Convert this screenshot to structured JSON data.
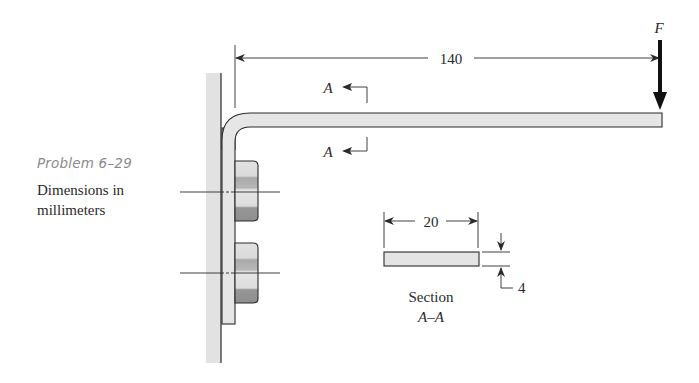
{
  "caption": {
    "title": "Problem 6–29",
    "body": "Dimensions in millimeters"
  },
  "labels": {
    "length_dim": "140",
    "force": "F",
    "section_mark_top": "A",
    "section_mark_bottom": "A",
    "width_dim": "20",
    "thickness_dim": "4",
    "section_title": "Section",
    "section_name": "A–A"
  },
  "colors": {
    "fill_light": "#e4e4e4",
    "fill_nut_dark": "#9c9c9c",
    "stroke": "#2a2a2a",
    "caption_title": "#8a8a8a"
  }
}
